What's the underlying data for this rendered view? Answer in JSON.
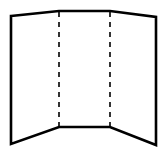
{
  "diagram": {
    "colors": {
      "stroke": "#000000",
      "background": "#ffffff"
    },
    "outline_points": "11,16 59,11 110,11 156,17 156,145 110,127 59,127 11,144",
    "fold_lines": [
      {
        "x1": 59,
        "y1": 12,
        "x2": 59,
        "y2": 126
      },
      {
        "x1": 110,
        "y1": 12,
        "x2": 110,
        "y2": 126
      }
    ],
    "panels": [
      "left",
      "center",
      "right"
    ]
  }
}
